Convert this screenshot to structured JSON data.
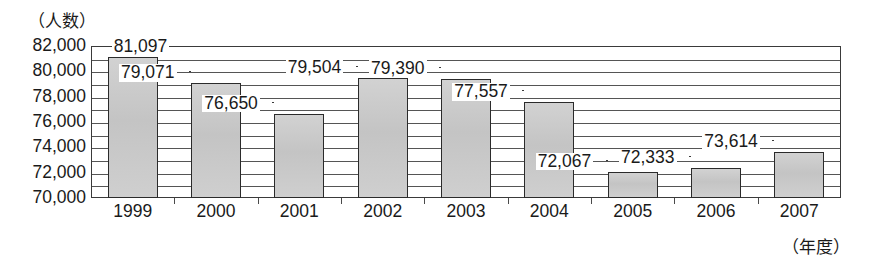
{
  "chart_data": {
    "type": "bar",
    "title": "",
    "ylabel": "（人数）",
    "xlabel": "（年度）",
    "categories": [
      "1999",
      "2000",
      "2001",
      "2002",
      "2003",
      "2004",
      "2005",
      "2006",
      "2007"
    ],
    "values": [
      81097,
      79071,
      76650,
      79504,
      79390,
      77557,
      72067,
      72333,
      73614
    ],
    "value_labels": [
      "81,097",
      "79,071",
      "76,650",
      "79,504",
      "79,390",
      "77,557",
      "72,067",
      "72,333",
      "73,614"
    ],
    "ylim": [
      70000,
      82000
    ],
    "ytick_labels": [
      "82,000",
      "80,000",
      "78,000",
      "76,000",
      "74,000",
      "72,000",
      "70,000"
    ],
    "ytick_values": [
      82000,
      80000,
      78000,
      76000,
      74000,
      72000,
      70000
    ],
    "gridline_values": [
      82000,
      81000,
      80000,
      79000,
      78000,
      77000,
      76000,
      75000,
      74000,
      73000,
      72000,
      71000,
      70000
    ],
    "grid": true,
    "grid_interval": 1000,
    "legend": "none",
    "bar_fill_color": "#c9c9c9",
    "bar_border_color": "#2b2b2b",
    "axis_color": "#3a3a3a"
  }
}
